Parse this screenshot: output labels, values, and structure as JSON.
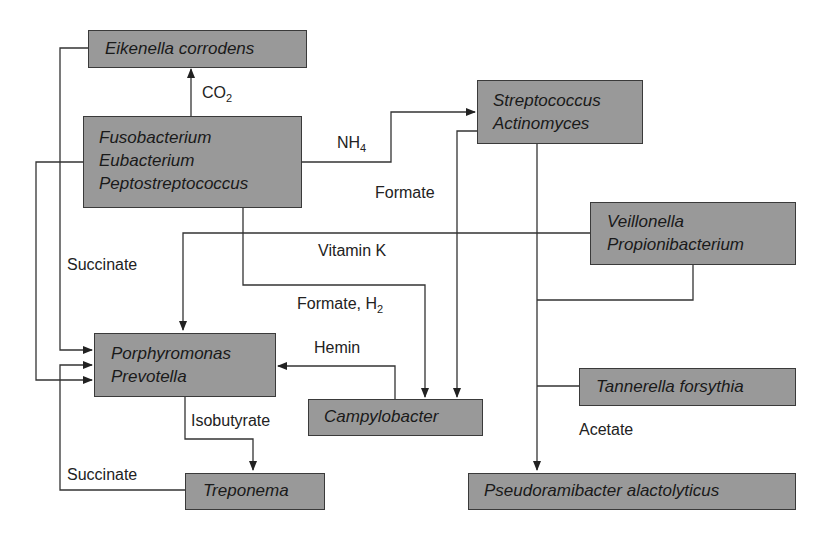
{
  "diagram": {
    "title": "",
    "colors": {
      "box_fill": "#999999",
      "box_border": "#3a3a3a",
      "line": "#333333",
      "background": "#ffffff"
    },
    "nodes": [
      {
        "id": "eikenella",
        "lines": [
          "Eikenella corrodens"
        ]
      },
      {
        "id": "fuso",
        "lines": [
          "Fusobacterium",
          "Eubacterium",
          "Peptostreptococcus"
        ]
      },
      {
        "id": "strep",
        "lines": [
          "Streptococcus",
          "Actinomyces"
        ]
      },
      {
        "id": "veillonella",
        "lines": [
          "Veillonella",
          "Propionibacterium"
        ]
      },
      {
        "id": "porphyromonas",
        "lines": [
          "Porphyromonas",
          "Prevotella"
        ]
      },
      {
        "id": "campylobacter",
        "lines": [
          "Campylobacter"
        ]
      },
      {
        "id": "tannerella",
        "lines": [
          "Tannerella forsythia"
        ]
      },
      {
        "id": "treponema",
        "lines": [
          "Treponema"
        ]
      },
      {
        "id": "pseudoramibacter",
        "lines": [
          "Pseudoramibacter alactolyticus"
        ]
      }
    ],
    "labels": {
      "co2": {
        "main": "CO",
        "sub": "2"
      },
      "nh4": {
        "main": "NH",
        "sub": "4"
      },
      "formate": "Formate",
      "vitamin_k": "Vitamin K",
      "succinate_top": "Succinate",
      "formate_h2": {
        "main": "Formate, H",
        "sub": "2"
      },
      "hemin": "Hemin",
      "isobutyrate": "Isobutyrate",
      "succinate_bottom": "Succinate",
      "acetate": "Acetate"
    },
    "edges": [
      {
        "from": "fuso",
        "to": "eikenella",
        "label": "CO2"
      },
      {
        "from": "fuso",
        "to": "strep",
        "label": "NH4"
      },
      {
        "from": "strep",
        "to": "campylobacter",
        "label": "Formate"
      },
      {
        "from": "veillonella",
        "to": "porphyromonas",
        "label": "Vitamin K"
      },
      {
        "from": "eikenella",
        "to": "porphyromonas",
        "label": "Succinate"
      },
      {
        "from": "fuso",
        "to": "porphyromonas",
        "label": ""
      },
      {
        "from": "fuso",
        "to": "campylobacter",
        "label": "Formate, H2"
      },
      {
        "from": "campylobacter",
        "to": "porphyromonas",
        "label": "Hemin"
      },
      {
        "from": "porphyromonas",
        "to": "treponema",
        "label": "Isobutyrate"
      },
      {
        "from": "treponema",
        "to": "porphyromonas",
        "label": "Succinate"
      },
      {
        "from": "strep",
        "to": "pseudoramibacter",
        "label": "Acetate"
      },
      {
        "from": "veillonella",
        "to": "pseudoramibacter",
        "label": "Acetate"
      },
      {
        "from": "tannerella",
        "to": "pseudoramibacter",
        "label": "Acetate"
      }
    ]
  }
}
